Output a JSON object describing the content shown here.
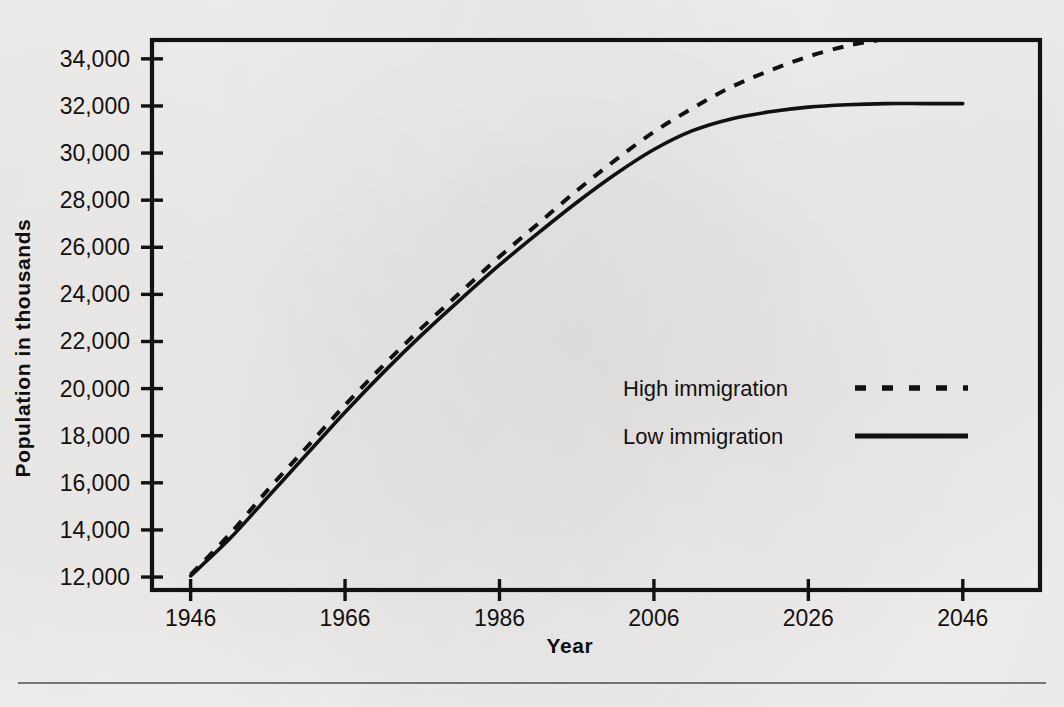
{
  "chart_data": {
    "type": "line",
    "title": "",
    "subtitle": "",
    "xlabel": "Year",
    "ylabel": "Population in thousands",
    "xlim": [
      1941,
      2056
    ],
    "ylim": [
      11450,
      34800
    ],
    "xticks": [
      1946,
      1966,
      1986,
      2006,
      2026,
      2046
    ],
    "xtick_labels": [
      "1946",
      "1966",
      "1986",
      "2006",
      "2026",
      "2046"
    ],
    "yticks": [
      12000,
      14000,
      16000,
      18000,
      20000,
      22000,
      24000,
      26000,
      28000,
      30000,
      32000,
      34000
    ],
    "ytick_labels": [
      "12,000",
      "14,000",
      "16,000",
      "18,000",
      "20,000",
      "22,000",
      "24,000",
      "26,000",
      "28,000",
      "30,000",
      "32,000",
      "34,000"
    ],
    "grid": false,
    "legend_position": "center-right",
    "x": [
      1946,
      1951,
      1956,
      1961,
      1966,
      1971,
      1976,
      1981,
      1986,
      1991,
      1996,
      2001,
      2006,
      2011,
      2016,
      2021,
      2026,
      2031,
      2036,
      2041,
      2046
    ],
    "series": [
      {
        "name": "High immigration",
        "style": "dashed",
        "color": "#121110",
        "values": [
          12100,
          13800,
          15700,
          17500,
          19300,
          21000,
          22600,
          24100,
          25600,
          27000,
          28400,
          29700,
          30900,
          31900,
          32800,
          33500,
          34100,
          34550,
          34850,
          35050,
          35150
        ]
      },
      {
        "name": "Low immigration",
        "style": "solid",
        "color": "#121110",
        "values": [
          12050,
          13600,
          15400,
          17200,
          19000,
          20700,
          22300,
          23800,
          25250,
          26600,
          27900,
          29100,
          30150,
          30950,
          31450,
          31750,
          31950,
          32050,
          32100,
          32100,
          32100
        ]
      }
    ],
    "annotations": []
  },
  "axes": {
    "x_title": "Year",
    "y_title": "Population in thousands"
  },
  "legend": {
    "entries": [
      {
        "label": "High immigration",
        "style": "dashed"
      },
      {
        "label": "Low immigration",
        "style": "solid"
      }
    ]
  }
}
